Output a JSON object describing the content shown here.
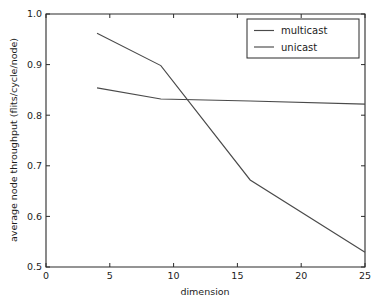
{
  "chart_data": {
    "type": "line",
    "title": "",
    "xlabel": "dimension",
    "ylabel": "average node throughput (flits/cycle/node)",
    "xlim": [
      0,
      25
    ],
    "ylim": [
      0.5,
      1.0
    ],
    "grid": false,
    "legend_position": "upper right",
    "xticks": [
      0,
      5,
      10,
      15,
      20,
      25
    ],
    "xtick_labels": [
      "0",
      "5",
      "10",
      "15",
      "20",
      "25"
    ],
    "yticks": [
      0.5,
      0.6,
      0.7,
      0.8,
      0.9,
      1.0
    ],
    "ytick_labels": [
      "0.5",
      "0.6",
      "0.7",
      "0.8",
      "0.9",
      "1.0"
    ],
    "x": [
      4,
      9,
      16,
      25
    ],
    "series": [
      {
        "name": "multicast",
        "values": [
          0.962,
          0.898,
          0.672,
          0.529
        ],
        "color": "#4a4a4a"
      },
      {
        "name": "unicast",
        "values": [
          0.854,
          0.832,
          0.828,
          0.822
        ],
        "color": "#4a4a4a"
      }
    ]
  },
  "legend": {
    "entries": [
      {
        "label": "multicast"
      },
      {
        "label": "unicast"
      }
    ]
  },
  "axes": {
    "x_title": "dimension",
    "y_title": "average node throughput (flits/cycle/node)"
  }
}
